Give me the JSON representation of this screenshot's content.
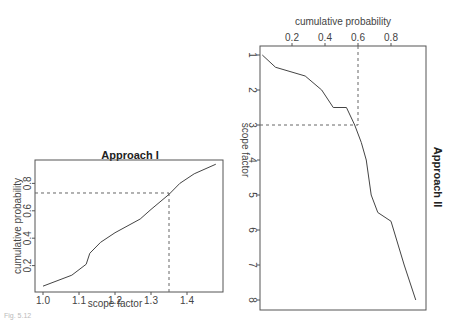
{
  "chart_data": [
    {
      "type": "line",
      "title": "Approach I",
      "xlabel": "scope factor",
      "ylabel": "cumulative probability",
      "xlim": [
        0.98,
        1.5
      ],
      "ylim": [
        0.02,
        1.0
      ],
      "x_ticks": [
        "1.0",
        "1.1",
        "1.2",
        "1.3",
        "1.4"
      ],
      "y_ticks": [
        "0.2",
        "0.4",
        "0.6",
        "0.8"
      ],
      "grid": false,
      "series": [
        {
          "name": "cumulative probability",
          "x": [
            1.0,
            1.08,
            1.12,
            1.13,
            1.16,
            1.2,
            1.27,
            1.3,
            1.35,
            1.38,
            1.42,
            1.48
          ],
          "y": [
            0.05,
            0.13,
            0.21,
            0.29,
            0.37,
            0.44,
            0.54,
            0.61,
            0.72,
            0.8,
            0.87,
            0.94
          ]
        }
      ],
      "annotations": [
        {
          "type": "dashed-hline",
          "y": 0.73,
          "from_x": 1.0,
          "to_x": 1.35
        },
        {
          "type": "dashed-vline",
          "x": 1.35,
          "from_y": 0.0,
          "to_y": 0.73
        }
      ]
    },
    {
      "type": "line",
      "title": "Approach II",
      "xlabel": "cumulative probability",
      "ylabel": "scope factor",
      "orientation": "rotated: x-axis on top, y-axis inverted (1 at top, 8 at bottom), title rotated on right",
      "xlim": [
        0.0,
        1.0
      ],
      "ylim": [
        8.2,
        0.9
      ],
      "x_ticks": [
        "0.2",
        "0.4",
        "0.6",
        "0.8"
      ],
      "y_ticks": [
        "1",
        "2",
        "3",
        "4",
        "5",
        "6",
        "7",
        "8"
      ],
      "grid": false,
      "series": [
        {
          "name": "scope factor",
          "x": [
            0.02,
            0.1,
            0.28,
            0.38,
            0.45,
            0.53,
            0.58,
            0.62,
            0.65,
            0.68,
            0.72,
            0.8,
            0.88,
            0.95
          ],
          "y": [
            1.0,
            1.35,
            1.6,
            2.0,
            2.5,
            2.5,
            3.0,
            3.5,
            4.0,
            5.0,
            5.5,
            5.75,
            7.0,
            8.0
          ]
        }
      ],
      "annotations": [
        {
          "type": "dashed-vline",
          "x": 0.6,
          "from_y": 1.0,
          "to_y": 3.0
        },
        {
          "type": "dashed-hline",
          "y": 3.0,
          "from_x": 0.0,
          "to_x": 0.6
        }
      ]
    }
  ],
  "charts": {
    "left": {
      "title": "Approach I",
      "xlabel": "scope factor",
      "ylabel": "cumulative probability",
      "x_ticks": [
        "1.0",
        "1.1",
        "1.2",
        "1.3",
        "1.4"
      ],
      "y_ticks": [
        "0.2",
        "0.4",
        "0.6",
        "0.8"
      ]
    },
    "right": {
      "title": "Approach II",
      "xlabel": "cumulative probability",
      "ylabel": "scope factor",
      "x_ticks": [
        "0.2",
        "0.4",
        "0.6",
        "0.8"
      ],
      "y_ticks": [
        "1",
        "2",
        "3",
        "4",
        "5",
        "6",
        "7",
        "8"
      ]
    }
  },
  "caption": "Fig. 5.12"
}
